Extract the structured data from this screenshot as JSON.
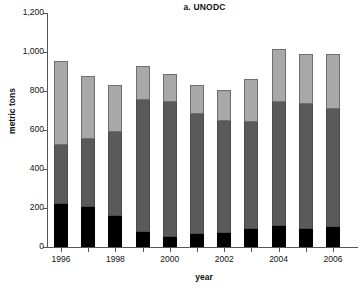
{
  "chart_data": {
    "type": "bar",
    "subtype": "stacked-bar",
    "title": "a. UNODC",
    "xlabel": "year",
    "ylabel": "metric tons",
    "grid": false,
    "legend": null,
    "categories": [
      "1996",
      "1997",
      "1998",
      "1999",
      "2000",
      "2001",
      "2002",
      "2003",
      "2004",
      "2005",
      "2006"
    ],
    "xtick_labels": [
      "1996",
      "",
      "1998",
      "",
      "2000",
      "",
      "2002",
      "",
      "2004",
      "",
      "2006"
    ],
    "ytick_labels": [
      "0",
      "200",
      "400",
      "600",
      "800",
      "1,000",
      "1,200"
    ],
    "ytick_values": [
      0,
      200,
      400,
      600,
      800,
      1000,
      1200
    ],
    "ylim": [
      0,
      1200
    ],
    "series": [
      {
        "name": "bottom-segment",
        "color": "#000000",
        "values": [
          222,
          205,
          157,
          75,
          50,
          68,
          72,
          90,
          108,
          90,
          102
        ]
      },
      {
        "name": "middle-segment",
        "color": "#5a5a5a",
        "values": [
          300,
          350,
          432,
          680,
          694,
          615,
          576,
          549,
          637,
          641,
          608
        ]
      },
      {
        "name": "top-segment",
        "color": "#a8a8a8",
        "values": [
          434,
          320,
          242,
          173,
          142,
          148,
          157,
          224,
          270,
          259,
          282
        ]
      }
    ],
    "totals": [
      956,
      875,
      831,
      928,
      886,
      831,
      805,
      863,
      1015,
      990,
      992
    ]
  },
  "colors": {
    "bottom": "#000000",
    "middle": "#5a5a5a",
    "top": "#a8a8a8",
    "axis": "#555555",
    "text": "#111111",
    "background": "#ffffff"
  }
}
